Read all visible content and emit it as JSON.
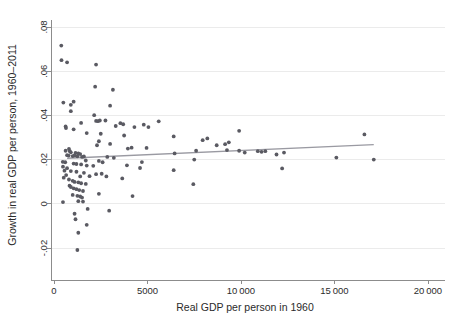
{
  "chart_data": {
    "type": "scatter",
    "title": "",
    "xlabel": "Real GDP per person in 1960",
    "ylabel": "Growth in real GDP per person, 1960–2011",
    "xlim": [
      0,
      20000
    ],
    "ylim": [
      -0.022,
      0.082
    ],
    "grid": true,
    "legend": null,
    "xticks": [
      0,
      5000,
      10000,
      15000,
      20000
    ],
    "xtick_labels": [
      "0",
      "5000",
      "10 000",
      "15 000",
      "20 000"
    ],
    "yticks": [
      -0.02,
      0,
      0.02,
      0.04,
      0.06,
      0.08
    ],
    "ytick_labels": [
      "-.02",
      "0",
      ".02",
      ".04",
      ".06",
      ".08"
    ],
    "point_color": "#5a5a62",
    "gridline_color": "#ebebeb",
    "axis_color": "#8c8c8c",
    "fit_line": {
      "name": "linear fit",
      "color": "#9a9aa2",
      "x": [
        700,
        17100
      ],
      "y": [
        0.0206,
        0.0268
      ]
    },
    "series": [
      {
        "name": "Countries",
        "points": [
          [
            390,
            0.0716
          ],
          [
            400,
            0.065
          ],
          [
            700,
            0.064
          ],
          [
            2250,
            0.063
          ],
          [
            2200,
            0.053
          ],
          [
            3150,
            0.0516
          ],
          [
            500,
            0.0458
          ],
          [
            1050,
            0.0462
          ],
          [
            900,
            0.0448
          ],
          [
            3000,
            0.0444
          ],
          [
            900,
            0.0419
          ],
          [
            2150,
            0.0401
          ],
          [
            2250,
            0.0375
          ],
          [
            2350,
            0.0374
          ],
          [
            2450,
            0.0377
          ],
          [
            2750,
            0.0377
          ],
          [
            5600,
            0.0373
          ],
          [
            1450,
            0.0366
          ],
          [
            3550,
            0.0365
          ],
          [
            3700,
            0.036
          ],
          [
            4800,
            0.0358
          ],
          [
            620,
            0.035
          ],
          [
            640,
            0.0343
          ],
          [
            1050,
            0.0337
          ],
          [
            3300,
            0.0352
          ],
          [
            4300,
            0.0347
          ],
          [
            5050,
            0.0347
          ],
          [
            9900,
            0.033
          ],
          [
            16600,
            0.0314
          ],
          [
            1750,
            0.032
          ],
          [
            2500,
            0.0317
          ],
          [
            3750,
            0.0309
          ],
          [
            6400,
            0.0305
          ],
          [
            8200,
            0.0296
          ],
          [
            7950,
            0.0288
          ],
          [
            9350,
            0.0278
          ],
          [
            2400,
            0.0283
          ],
          [
            9150,
            0.027
          ],
          [
            8700,
            0.0265
          ],
          [
            2300,
            0.0265
          ],
          [
            3000,
            0.0271
          ],
          [
            4150,
            0.0254
          ],
          [
            4950,
            0.0253
          ],
          [
            3950,
            0.025
          ],
          [
            800,
            0.0248
          ],
          [
            9250,
            0.0243
          ],
          [
            9900,
            0.024
          ],
          [
            10900,
            0.0238
          ],
          [
            11300,
            0.0238
          ],
          [
            7600,
            0.024
          ],
          [
            11100,
            0.0235
          ],
          [
            10200,
            0.0232
          ],
          [
            620,
            0.024
          ],
          [
            850,
            0.0238
          ],
          [
            900,
            0.0233
          ],
          [
            1150,
            0.023
          ],
          [
            1300,
            0.0228
          ],
          [
            1400,
            0.0225
          ],
          [
            6450,
            0.0228
          ],
          [
            11900,
            0.0223
          ],
          [
            12300,
            0.0232
          ],
          [
            700,
            0.022
          ],
          [
            780,
            0.0218
          ],
          [
            1000,
            0.0216
          ],
          [
            1100,
            0.0219
          ],
          [
            1250,
            0.0215
          ],
          [
            1500,
            0.0212
          ],
          [
            1600,
            0.0214
          ],
          [
            2850,
            0.0212
          ],
          [
            3200,
            0.0208
          ],
          [
            15100,
            0.0209
          ],
          [
            17100,
            0.02
          ],
          [
            7500,
            0.02
          ],
          [
            1700,
            0.0196
          ],
          [
            2400,
            0.0194
          ],
          [
            4700,
            0.0189
          ],
          [
            470,
            0.019
          ],
          [
            600,
            0.0188
          ],
          [
            1050,
            0.0182
          ],
          [
            1200,
            0.018
          ],
          [
            1450,
            0.0178
          ],
          [
            1750,
            0.0173
          ],
          [
            2100,
            0.0172
          ],
          [
            2600,
            0.0188
          ],
          [
            3900,
            0.0174
          ],
          [
            4600,
            0.0162
          ],
          [
            480,
            0.0168
          ],
          [
            700,
            0.0161
          ],
          [
            6400,
            0.0152
          ],
          [
            12200,
            0.016
          ],
          [
            560,
            0.015
          ],
          [
            900,
            0.0148
          ],
          [
            1200,
            0.0145
          ],
          [
            1600,
            0.014
          ],
          [
            2250,
            0.0134
          ],
          [
            2550,
            0.0136
          ],
          [
            650,
            0.013
          ],
          [
            1400,
            0.0124
          ],
          [
            1900,
            0.0125
          ],
          [
            2800,
            0.0124
          ],
          [
            3650,
            0.0115
          ],
          [
            520,
            0.0118
          ],
          [
            800,
            0.011
          ],
          [
            1000,
            0.0104
          ],
          [
            1100,
            0.0099
          ],
          [
            1300,
            0.0097
          ],
          [
            1450,
            0.0093
          ],
          [
            1700,
            0.009
          ],
          [
            7450,
            0.0089
          ],
          [
            830,
            0.0082
          ],
          [
            900,
            0.0076
          ],
          [
            1050,
            0.007
          ],
          [
            1200,
            0.0066
          ],
          [
            1350,
            0.0062
          ],
          [
            1550,
            0.0058
          ],
          [
            2400,
            0.0045
          ],
          [
            1000,
            0.004
          ],
          [
            1250,
            0.0036
          ],
          [
            1400,
            0.0033
          ],
          [
            1500,
            0.0028
          ],
          [
            4200,
            0.0035
          ],
          [
            480,
            0.0008
          ],
          [
            1300,
            0.0012
          ],
          [
            1550,
            0.001
          ],
          [
            1800,
            -0.0023
          ],
          [
            2950,
            -0.0031
          ],
          [
            1100,
            -0.0045
          ],
          [
            1150,
            -0.007
          ],
          [
            1750,
            -0.0095
          ],
          [
            1300,
            -0.0131
          ],
          [
            1250,
            -0.0209
          ]
        ]
      }
    ]
  }
}
